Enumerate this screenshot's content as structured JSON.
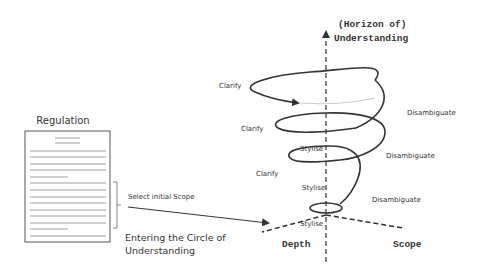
{
  "document": {
    "title": "Regulation",
    "bracket_label": "Select initial Scope"
  },
  "entry": {
    "line1": "Entering the Circle of",
    "line2": "Understanding"
  },
  "axes": {
    "vertical_line1": "(Horizon of)",
    "vertical_line2": "Understanding",
    "left": "Depth",
    "right": "Scope"
  },
  "spiral": {
    "left_labels": [
      "Clarify",
      "Clarify",
      "Clarify"
    ],
    "center_labels": [
      "Stylise",
      "Stylise",
      "Stylise"
    ],
    "right_labels": [
      "Disambiguate",
      "Disambiguate",
      "Disambiguate"
    ]
  },
  "colors": {
    "stroke": "#333333",
    "text": "#333333",
    "background": "#ffffff"
  }
}
